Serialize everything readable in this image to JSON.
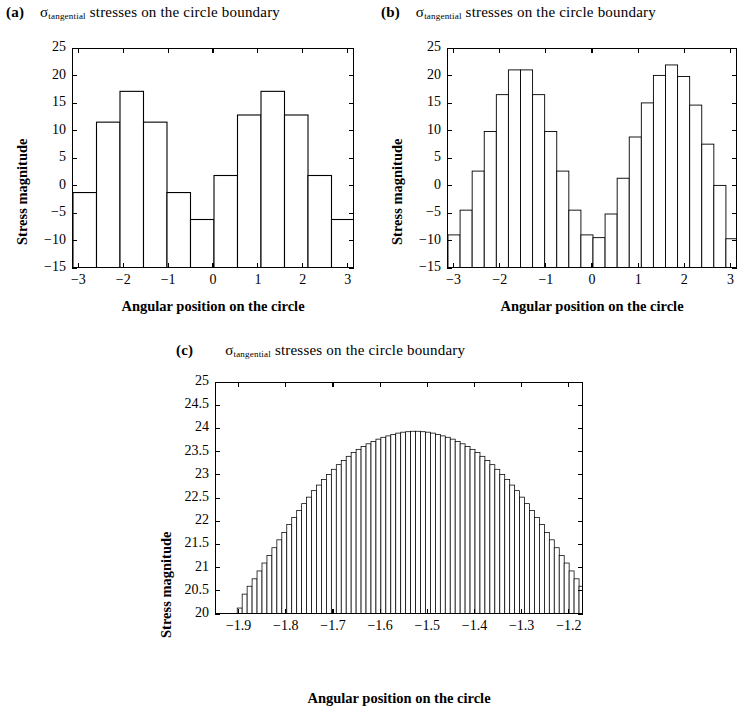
{
  "figure": {
    "axis_label_x": "Angular position on the circle",
    "axis_label_y": "Stress magnitude",
    "title_main": "stresses on the circle boundary",
    "sigma_symbol": "σ",
    "sigma_subscript": "tangential"
  },
  "panels": [
    {
      "letter": "(a)",
      "title": "stresses on the circle boundary"
    },
    {
      "letter": "(b)",
      "title": "stresses on the circle boundary"
    },
    {
      "letter": "(c)",
      "title": "stresses on the circle boundary"
    }
  ],
  "chart_data": [
    {
      "type": "bar",
      "panel": "(a)",
      "title": "σ_tangential stresses on the circle boundary",
      "xlabel": "Angular position on the circle",
      "ylabel": "Stress magnitude",
      "xlim": [
        -3.1416,
        3.1416
      ],
      "ylim": [
        -15,
        25
      ],
      "xticks": [
        -3,
        -2,
        -1,
        0,
        1,
        2,
        3
      ],
      "xticklabels": [
        "−3",
        "−2",
        "−1",
        "0",
        "1",
        "2",
        "3"
      ],
      "yticks": [
        -15,
        -10,
        -5,
        0,
        5,
        10,
        15,
        20,
        25
      ],
      "yticklabels": [
        "−15",
        "−10",
        "−5",
        "0",
        "5",
        "10",
        "15",
        "20",
        "25"
      ],
      "grid": false,
      "bar_baseline": -15,
      "bin_edges": [
        -3.1416,
        -2.618,
        -2.0944,
        -1.5708,
        -1.0472,
        -0.5236,
        0.0,
        0.5236,
        1.0472,
        1.5708,
        2.0944,
        2.618,
        3.1416
      ],
      "values": [
        -1.1,
        11.7,
        17.3,
        11.7,
        -1.1,
        -6.0,
        2.0,
        13.0,
        17.3,
        13.0,
        2.0,
        -6.0
      ],
      "notes": "12 equal-width bars spanning -pi to pi"
    },
    {
      "type": "bar",
      "panel": "(b)",
      "title": "σ_tangential stresses on the circle boundary",
      "xlabel": "Angular position on the circle",
      "ylabel": "Stress magnitude",
      "xlim": [
        -3.1416,
        3.1416
      ],
      "ylim": [
        -15,
        25
      ],
      "xticks": [
        -3,
        -2,
        -1,
        0,
        1,
        2,
        3
      ],
      "xticklabels": [
        "−3",
        "−2",
        "−1",
        "0",
        "1",
        "2",
        "3"
      ],
      "yticks": [
        -15,
        -10,
        -5,
        0,
        5,
        10,
        15,
        20,
        25
      ],
      "yticklabels": [
        "−15",
        "−10",
        "−5",
        "0",
        "5",
        "10",
        "15",
        "20",
        "25"
      ],
      "grid": false,
      "bar_baseline": -15,
      "n_bins": 24,
      "values": [
        -8.8,
        -4.3,
        2.8,
        10.0,
        16.7,
        21.2,
        21.2,
        16.7,
        10.0,
        2.8,
        -4.3,
        -8.8,
        -9.3,
        -5.0,
        1.5,
        9.0,
        15.2,
        20.2,
        22.1,
        20.0,
        14.8,
        7.7,
        0.2,
        -9.5
      ],
      "notes": "24 equal-width bars spanning -pi to pi"
    },
    {
      "type": "bar",
      "panel": "(c)",
      "title": "σ_tangential stresses on the circle boundary",
      "xlabel": "Angular position on the circle",
      "ylabel": "Stress magnitude",
      "xlim": [
        -1.95,
        -1.17
      ],
      "ylim": [
        20,
        25
      ],
      "xticks": [
        -1.9,
        -1.8,
        -1.7,
        -1.6,
        -1.5,
        -1.4,
        -1.3,
        -1.2
      ],
      "xticklabels": [
        "−1.9",
        "−1.8",
        "−1.7",
        "−1.6",
        "−1.5",
        "−1.4",
        "−1.3",
        "−1.2"
      ],
      "yticks": [
        20,
        20.5,
        21,
        21.5,
        22,
        22.5,
        23,
        23.5,
        24,
        24.5,
        25
      ],
      "yticklabels": [
        "20",
        "20.5",
        "21",
        "21.5",
        "22",
        "22.5",
        "23",
        "23.5",
        "24",
        "24.5",
        "25"
      ],
      "grid": false,
      "bar_baseline": 20,
      "x_start": -1.905,
      "x_step": 0.0105,
      "values": [
        20.15,
        20.45,
        20.62,
        20.78,
        20.95,
        21.12,
        21.28,
        21.45,
        21.62,
        21.78,
        21.95,
        22.1,
        22.25,
        22.4,
        22.54,
        22.68,
        22.8,
        22.92,
        23.03,
        23.14,
        23.24,
        23.33,
        23.42,
        23.5,
        23.57,
        23.63,
        23.69,
        23.74,
        23.79,
        23.83,
        23.86,
        23.89,
        23.92,
        23.94,
        23.95,
        23.96,
        23.96,
        23.95,
        23.94,
        23.92,
        23.89,
        23.86,
        23.83,
        23.79,
        23.74,
        23.69,
        23.63,
        23.57,
        23.5,
        23.42,
        23.33,
        23.24,
        23.14,
        23.03,
        22.92,
        22.8,
        22.68,
        22.54,
        22.4,
        22.25,
        22.1,
        21.95,
        21.78,
        21.62,
        21.45,
        21.28,
        21.12,
        20.95,
        20.78,
        20.62,
        20.45,
        20.15
      ],
      "notes": "dense histogram, ~72 narrow bars, smooth arch peaking near 24 at x = -1.57"
    }
  ]
}
